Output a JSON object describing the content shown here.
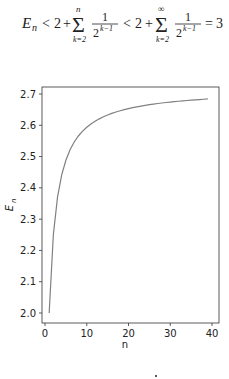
{
  "formula": {
    "lhs": "E",
    "lhs_sub": "n",
    "lt1": "<",
    "two_a": "2",
    "plus_a": "+",
    "sum1_upper": "n",
    "sum1_lower": "k=2",
    "frac1_num": "1",
    "frac1_den_base": "2",
    "frac1_den_exp": "k−1",
    "lt2": "<",
    "two_b": "2",
    "plus_b": "+",
    "sum2_upper": "∞",
    "sum2_lower": "k=2",
    "frac2_num": "1",
    "frac2_den_base": "2",
    "frac2_den_exp": "k−1",
    "eq": "=",
    "rhs": "3"
  },
  "chart_data": {
    "type": "line",
    "title": "",
    "xlabel": "n",
    "ylabel": "E_n",
    "ylabel_base": "E",
    "ylabel_sub": "n",
    "xlim": [
      -1.5,
      41
    ],
    "ylim": [
      1.966,
      2.72
    ],
    "xticks": [
      0,
      10,
      20,
      30,
      40
    ],
    "xtick_labels": [
      "0",
      "10",
      "20",
      "30",
      "40"
    ],
    "yticks": [
      2.0,
      2.1,
      2.2,
      2.3,
      2.4,
      2.5,
      2.6,
      2.7
    ],
    "ytick_labels": [
      "2.0",
      "2.1",
      "2.2",
      "2.3",
      "2.4",
      "2.5",
      "2.6",
      "2.7"
    ],
    "grid": false,
    "legend": null,
    "series": [
      {
        "name": "E_n",
        "color": "#808080",
        "x": [
          1,
          2,
          3,
          4,
          5,
          6,
          7,
          8,
          9,
          10,
          11,
          12,
          13,
          14,
          15,
          16,
          17,
          18,
          19,
          20,
          21,
          22,
          23,
          24,
          25,
          26,
          27,
          28,
          29,
          30,
          31,
          32,
          33,
          34,
          35,
          36,
          37,
          38,
          39
        ],
        "values": [
          2.0,
          2.25,
          2.3704,
          2.4414,
          2.4883,
          2.5216,
          2.5465,
          2.5658,
          2.5812,
          2.5937,
          2.6042,
          2.613,
          2.6206,
          2.6272,
          2.6329,
          2.6379,
          2.6424,
          2.6464,
          2.65,
          2.6533,
          2.6563,
          2.659,
          2.6615,
          2.6637,
          2.6658,
          2.6678,
          2.6696,
          2.6712,
          2.6728,
          2.6743,
          2.6756,
          2.6769,
          2.6781,
          2.6793,
          2.6803,
          2.6814,
          2.6823,
          2.6832,
          2.6841
        ]
      }
    ]
  },
  "footer": {
    "mark": "·"
  }
}
